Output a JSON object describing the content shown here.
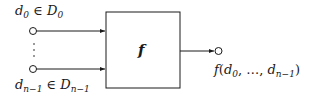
{
  "diagram": {
    "type": "function-block",
    "function_label": "f",
    "inputs": [
      {
        "var": "d",
        "index": "0",
        "relation": "∈",
        "set": "D",
        "set_index": "0"
      },
      {
        "var": "d",
        "index": "n−1",
        "relation": "∈",
        "set": "D",
        "set_index": "n−1"
      }
    ],
    "ellipsis": "⋮",
    "output": {
      "func": "f",
      "open": "(",
      "first": "d",
      "first_index": "0",
      "middle": ", …, ",
      "last": "d",
      "last_index": "n−1",
      "close": ")"
    },
    "colors": {
      "stroke": "#1a1a1a",
      "background": "#ffffff"
    }
  }
}
